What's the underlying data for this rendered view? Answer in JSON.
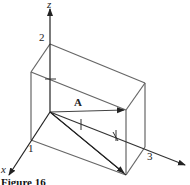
{
  "figure": {
    "caption": "Figure 16",
    "axes": {
      "x_label": "x",
      "y_label": "",
      "z_label": "z"
    },
    "tick_labels": {
      "x": "1",
      "y": "3",
      "z": "2"
    },
    "vector_label": "A",
    "colors": {
      "line": "#555555",
      "dark_line": "#222222",
      "background": "#ffffff"
    }
  }
}
